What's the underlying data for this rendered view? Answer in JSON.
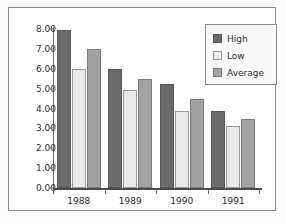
{
  "chart_data": {
    "type": "bar",
    "title": "",
    "xlabel": "",
    "ylabel": "",
    "categories": [
      "1988",
      "1989",
      "1990",
      "1991"
    ],
    "series": [
      {
        "name": "High",
        "color": "#6b6b6b",
        "values": [
          7.95,
          6.0,
          5.25,
          3.9
        ]
      },
      {
        "name": "Low",
        "color": "#e9e9e9",
        "values": [
          6.0,
          4.95,
          3.9,
          3.1
        ]
      },
      {
        "name": "Average",
        "color": "#a2a2a2",
        "values": [
          7.0,
          5.5,
          4.5,
          3.45
        ]
      }
    ],
    "ylim": [
      0,
      8
    ],
    "ytick_step": 1,
    "ytick_labels": [
      "8.00",
      "7.00",
      "6.00",
      "5.00",
      "4.00",
      "3.00",
      "2.00",
      "1.00",
      "0.00"
    ],
    "ytick_values": [
      8,
      7,
      6,
      5,
      4,
      3,
      2,
      1,
      0
    ],
    "grid": false,
    "legend_position": "top-right",
    "legend_entries": [
      "High",
      "Low",
      "Average"
    ]
  },
  "frame": {
    "border_color": "#8a8a8a",
    "background": "#ffffff"
  },
  "axis": {
    "line_color": "#6e6e6e",
    "text_color": "#2e2e2e"
  }
}
